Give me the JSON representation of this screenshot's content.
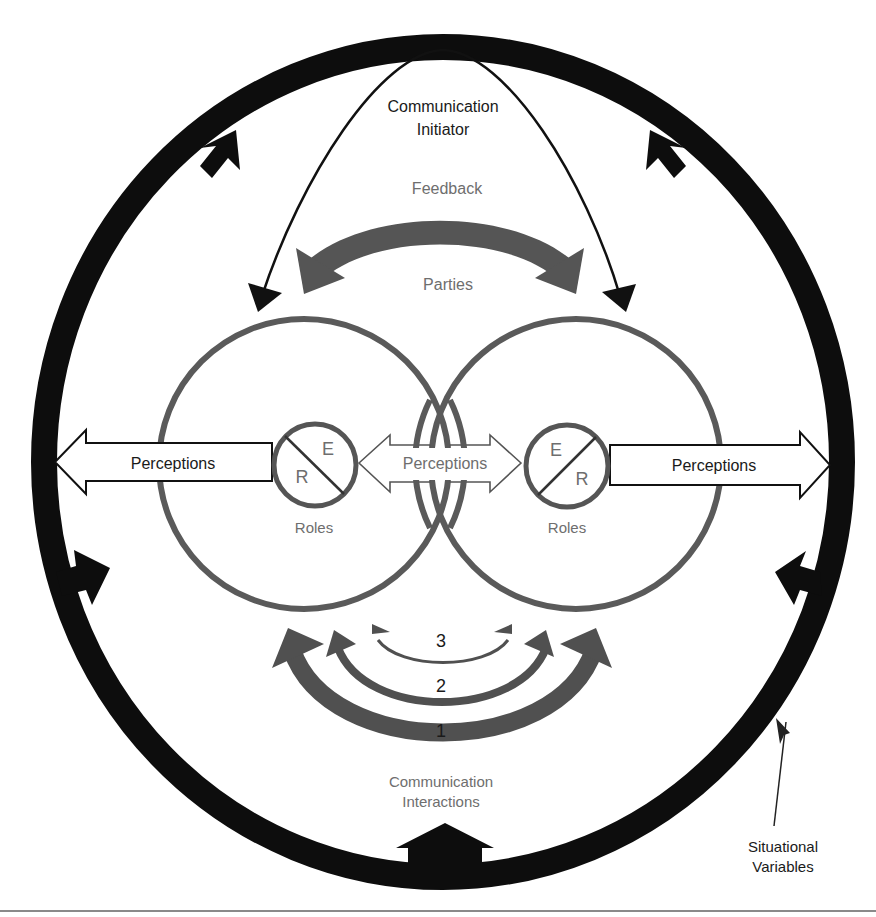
{
  "diagram": {
    "colors": {
      "outer_ring": "#0d0d0d",
      "party_circle": "#5a5a5a",
      "feedback_arrow": "#555555",
      "interaction_arrow": "#505050",
      "text_black": "#1a1a1a",
      "text_gray": "#6e6e6e",
      "rule": "#8a8a8a"
    },
    "labels": {
      "initiator_line1": "Communication",
      "initiator_line2": "Initiator",
      "feedback": "Feedback",
      "parties": "Parties",
      "perceptions_left": "Perceptions",
      "perceptions_center": "Perceptions",
      "perceptions_right": "Perceptions",
      "roles_left": "Roles",
      "roles_right": "Roles",
      "role_left_top": "E",
      "role_left_bottom": "R",
      "role_right_top": "E",
      "role_right_bottom": "R",
      "interaction_3": "3",
      "interaction_2": "2",
      "interaction_1": "1",
      "interactions_line1": "Communication",
      "interactions_line2": "Interactions",
      "situational_line1": "Situational",
      "situational_line2": "Variables"
    }
  }
}
